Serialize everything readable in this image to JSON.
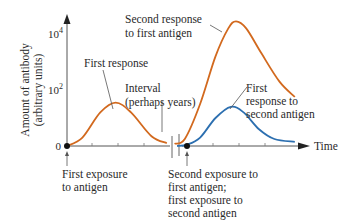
{
  "chart_data": {
    "type": "line",
    "title": "",
    "ylabel": [
      "Amount of antibody",
      "(arbitrary units)"
    ],
    "xlabel": "Time",
    "y_ticks": [
      {
        "label": "0",
        "value": 0
      },
      {
        "label": "10",
        "sup": "2",
        "value": 2
      },
      {
        "label": "10",
        "sup": "4",
        "value": 4
      }
    ],
    "ylim": [
      0,
      4.6
    ],
    "x_ticks_count": 7,
    "break_marker": {
      "label": [
        "Interval",
        "(perhaps years)"
      ]
    },
    "colors": {
      "first_antigen": "#d2691e",
      "second_antigen": "#2c6fb0",
      "axis": "#555555"
    },
    "series": [
      {
        "name": "First antigen",
        "color": "#d2691e",
        "points": [
          [
            0,
            0
          ],
          [
            0.6,
            0.3
          ],
          [
            1.3,
            1.2
          ],
          [
            1.9,
            1.55
          ],
          [
            2.5,
            1.2
          ],
          [
            3.3,
            0.35
          ],
          [
            3.9,
            0.1
          ],
          [
            4.2,
            0.08
          ],
          [
            4.6,
            0.25
          ],
          [
            5.2,
            1.5
          ],
          [
            5.8,
            3.2
          ],
          [
            6.3,
            4.2
          ],
          [
            6.6,
            4.45
          ],
          [
            7.0,
            4.2
          ],
          [
            7.6,
            3.3
          ],
          [
            8.3,
            2.3
          ],
          [
            8.9,
            1.75
          ]
        ]
      },
      {
        "name": "Second antigen",
        "color": "#2c6fb0",
        "points": [
          [
            4.3,
            0
          ],
          [
            4.7,
            0.05
          ],
          [
            5.2,
            0.3
          ],
          [
            5.8,
            1.0
          ],
          [
            6.4,
            1.4
          ],
          [
            6.9,
            1.2
          ],
          [
            7.5,
            0.6
          ],
          [
            8.1,
            0.25
          ],
          [
            8.9,
            0.15
          ]
        ]
      }
    ],
    "annotations": [
      {
        "id": "first-response",
        "lines": [
          "First response"
        ]
      },
      {
        "id": "second-response",
        "lines": [
          "Second response",
          "to first antigen"
        ]
      },
      {
        "id": "interval",
        "lines": [
          "Interval",
          "(perhaps years)"
        ]
      },
      {
        "id": "first-response-second",
        "lines": [
          "First",
          "response to",
          "second antigen"
        ]
      },
      {
        "id": "first-exposure",
        "lines": [
          "First exposure",
          "to antigen"
        ]
      },
      {
        "id": "second-exposure",
        "lines": [
          "Second exposure to",
          "first antigen;",
          "first exposure to",
          "second antigen"
        ]
      }
    ]
  }
}
